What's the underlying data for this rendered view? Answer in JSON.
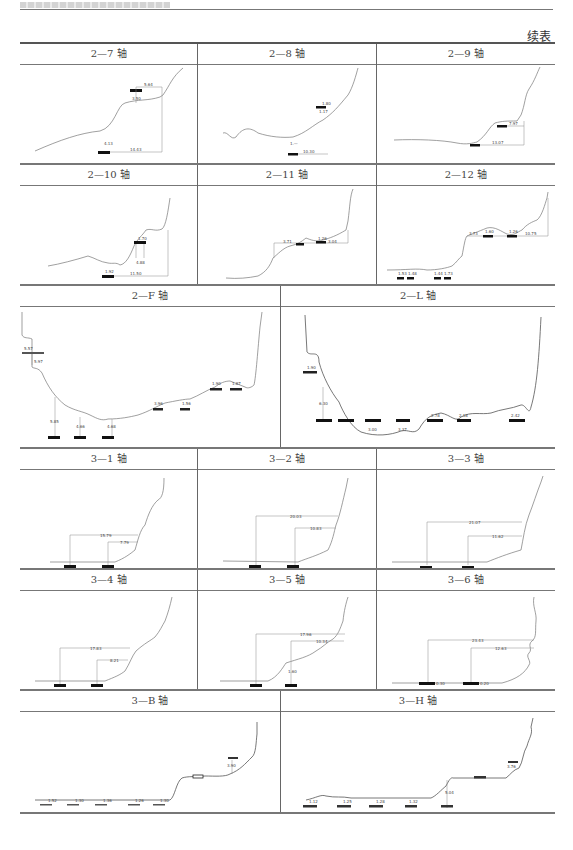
{
  "page": {
    "running_head": "",
    "continuation_label": "续表"
  },
  "table": {
    "rows": [
      {
        "cells": [
          {
            "title": "2—7 轴",
            "labels": [
              "5.64",
              "3.50",
              "4.13",
              "14.43"
            ]
          },
          {
            "title": "2—8 轴",
            "labels": [
              "1.80",
              "1.17",
              "1.—",
              "10.30"
            ]
          },
          {
            "title": "2—9 轴",
            "labels": [
              "7.97",
              "13.07"
            ]
          }
        ]
      },
      {
        "cells": [
          {
            "title": "2—10 轴",
            "labels": [
              "1.70",
              "4.88",
              "1.92",
              "11.50"
            ]
          },
          {
            "title": "2—11 轴",
            "labels": [
              "3.71",
              "1.26",
              "3.04"
            ]
          },
          {
            "title": "2—12 轴",
            "labels": [
              "3.73",
              "1.60",
              "1.26",
              "10.75",
              "1.53",
              "1.48",
              "1.44",
              "1.73"
            ]
          }
        ]
      },
      {
        "cells": [
          {
            "title": "2—F 轴",
            "labels": [
              "5.57",
              "5.97",
              "5.85",
              "4.66",
              "4.68",
              "3.96",
              "1.56",
              "1.90",
              "1.87"
            ]
          },
          {
            "title": "2—L 轴",
            "labels": [
              "1.90",
              "6.30",
              "3.00",
              "3.37",
              "2.78",
              "2.18",
              "2.42"
            ]
          }
        ]
      },
      {
        "cells": [
          {
            "title": "3—1 轴",
            "labels": [
              "15.79",
              "7.79"
            ]
          },
          {
            "title": "3—2 轴",
            "labels": [
              "20.03",
              "10.83"
            ]
          },
          {
            "title": "3—3 轴",
            "labels": [
              "21.07",
              "11.62"
            ]
          }
        ]
      },
      {
        "cells": [
          {
            "title": "3—4 轴",
            "labels": [
              "17.83",
              "8.21"
            ]
          },
          {
            "title": "3—5 轴",
            "labels": [
              "17.96",
              "10.34",
              "1.60"
            ]
          },
          {
            "title": "3—6 轴",
            "labels": [
              "23.43",
              "12.63",
              "0.30",
              "0.20"
            ]
          }
        ]
      },
      {
        "cells": [
          {
            "title": "3—B 轴",
            "labels": [
              "1.52",
              "1.30",
              "1.36",
              "1.26",
              "1.30",
              "3.90"
            ]
          },
          {
            "title": "3—H 轴",
            "labels": [
              "1.12",
              "1.25",
              "1.28",
              "1.32",
              "5.04",
              "3.76"
            ]
          }
        ]
      }
    ]
  }
}
